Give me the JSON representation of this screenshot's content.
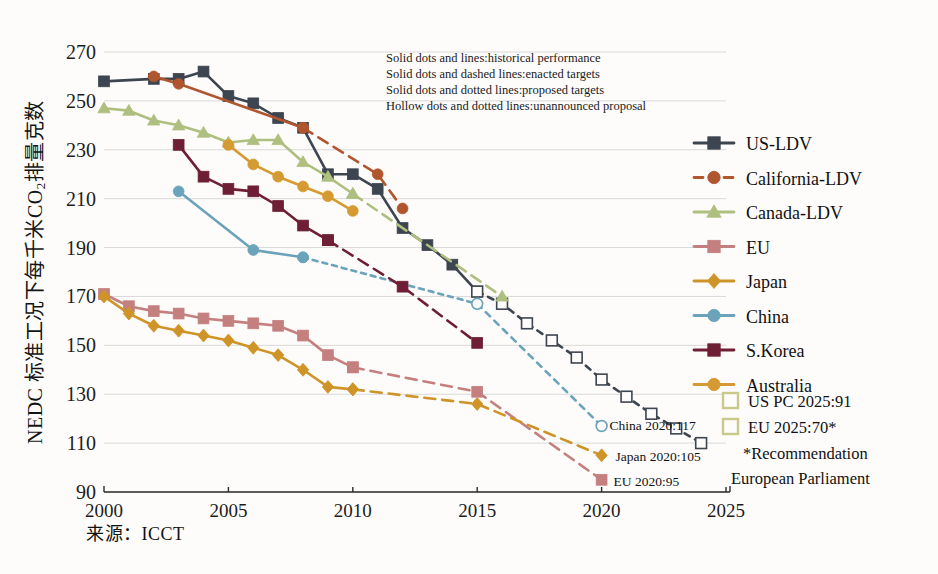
{
  "chart_data": {
    "type": "line",
    "title": "",
    "xlabel": "",
    "ylabel": "NEDC 标准工况下每千米CO2排量克数",
    "ylabel_prefix": "NEDC 标准工况下每千米CO",
    "ylabel_sub": "2",
    "ylabel_suffix": "排量克数",
    "source": "来源：ICCT",
    "xlim": [
      2000,
      2025.6
    ],
    "ylim": [
      90,
      270
    ],
    "yticks": [
      90,
      110,
      130,
      150,
      170,
      190,
      210,
      230,
      250,
      270
    ],
    "xticks": [
      2000,
      2005,
      2010,
      2015,
      2020,
      2025
    ],
    "grid": "horizontal",
    "legend_position": "right",
    "series": [
      {
        "name": "US-LDV",
        "color": "#3d4550",
        "marker": "square",
        "historical": [
          {
            "x": 2000,
            "y": 258
          },
          {
            "x": 2002,
            "y": 259
          },
          {
            "x": 2003,
            "y": 259
          },
          {
            "x": 2004,
            "y": 262
          },
          {
            "x": 2005,
            "y": 252
          },
          {
            "x": 2006,
            "y": 249
          },
          {
            "x": 2007,
            "y": 243
          },
          {
            "x": 2008,
            "y": 239
          },
          {
            "x": 2009,
            "y": 220
          },
          {
            "x": 2010,
            "y": 220
          },
          {
            "x": 2011,
            "y": 214
          },
          {
            "x": 2012,
            "y": 198
          },
          {
            "x": 2013,
            "y": 191
          },
          {
            "x": 2014,
            "y": 183
          },
          {
            "x": 2015,
            "y": 172
          }
        ],
        "unannounced": [
          {
            "x": 2015,
            "y": 172
          },
          {
            "x": 2016,
            "y": 167
          },
          {
            "x": 2017,
            "y": 159
          },
          {
            "x": 2018,
            "y": 152
          },
          {
            "x": 2019,
            "y": 145
          },
          {
            "x": 2020,
            "y": 136
          },
          {
            "x": 2021,
            "y": 129
          },
          {
            "x": 2022,
            "y": 122
          },
          {
            "x": 2023,
            "y": 116
          },
          {
            "x": 2024,
            "y": 110
          }
        ]
      },
      {
        "name": "California-LDV",
        "color": "#b0562f",
        "marker": "circle",
        "historical": [
          {
            "x": 2002,
            "y": 260
          },
          {
            "x": 2003,
            "y": 257
          },
          {
            "x": 2008,
            "y": 239
          }
        ],
        "enacted": [
          {
            "x": 2008,
            "y": 239
          },
          {
            "x": 2011,
            "y": 220
          },
          {
            "x": 2012,
            "y": 206
          }
        ]
      },
      {
        "name": "Canada-LDV",
        "color": "#aebf7f",
        "marker": "triangle",
        "historical": [
          {
            "x": 2000,
            "y": 247
          },
          {
            "x": 2001,
            "y": 246
          },
          {
            "x": 2002,
            "y": 242
          },
          {
            "x": 2003,
            "y": 240
          },
          {
            "x": 2004,
            "y": 237
          },
          {
            "x": 2005,
            "y": 233
          },
          {
            "x": 2006,
            "y": 234
          },
          {
            "x": 2007,
            "y": 234
          },
          {
            "x": 2008,
            "y": 225
          },
          {
            "x": 2009,
            "y": 219
          },
          {
            "x": 2010,
            "y": 212
          }
        ],
        "enacted": [
          {
            "x": 2010,
            "y": 212
          },
          {
            "x": 2016,
            "y": 170
          }
        ]
      },
      {
        "name": "EU",
        "color": "#c4807f",
        "marker": "square",
        "historical": [
          {
            "x": 2000,
            "y": 171
          },
          {
            "x": 2001,
            "y": 166
          },
          {
            "x": 2002,
            "y": 164
          },
          {
            "x": 2003,
            "y": 163
          },
          {
            "x": 2004,
            "y": 161
          },
          {
            "x": 2005,
            "y": 160
          },
          {
            "x": 2006,
            "y": 159
          },
          {
            "x": 2007,
            "y": 158
          },
          {
            "x": 2008,
            "y": 154
          },
          {
            "x": 2009,
            "y": 146
          },
          {
            "x": 2010,
            "y": 141
          }
        ],
        "enacted": [
          {
            "x": 2010,
            "y": 141
          },
          {
            "x": 2015,
            "y": 131
          },
          {
            "x": 2020,
            "y": 95
          }
        ]
      },
      {
        "name": "Japan",
        "color": "#cf9428",
        "marker": "diamond",
        "historical": [
          {
            "x": 2000,
            "y": 170
          },
          {
            "x": 2001,
            "y": 163
          },
          {
            "x": 2002,
            "y": 158
          },
          {
            "x": 2003,
            "y": 156
          },
          {
            "x": 2004,
            "y": 154
          },
          {
            "x": 2005,
            "y": 152
          },
          {
            "x": 2006,
            "y": 149
          },
          {
            "x": 2007,
            "y": 146
          },
          {
            "x": 2008,
            "y": 140
          },
          {
            "x": 2009,
            "y": 133
          },
          {
            "x": 2010,
            "y": 132
          }
        ],
        "enacted": [
          {
            "x": 2010,
            "y": 132
          },
          {
            "x": 2015,
            "y": 126
          },
          {
            "x": 2020,
            "y": 105
          }
        ]
      },
      {
        "name": "China",
        "color": "#6ba3bb",
        "marker": "circle",
        "historical": [
          {
            "x": 2003,
            "y": 213
          },
          {
            "x": 2006,
            "y": 189
          },
          {
            "x": 2008,
            "y": 186
          }
        ],
        "proposed": [
          {
            "x": 2008,
            "y": 186
          },
          {
            "x": 2015,
            "y": 167
          }
        ],
        "unannounced": [
          {
            "x": 2015,
            "y": 167
          },
          {
            "x": 2020,
            "y": 117
          }
        ]
      },
      {
        "name": "S.Korea",
        "color": "#6e1f36",
        "marker": "square",
        "historical": [
          {
            "x": 2003,
            "y": 232
          },
          {
            "x": 2004,
            "y": 219
          },
          {
            "x": 2005,
            "y": 214
          },
          {
            "x": 2006,
            "y": 213
          },
          {
            "x": 2007,
            "y": 207
          },
          {
            "x": 2008,
            "y": 199
          },
          {
            "x": 2009,
            "y": 193
          }
        ],
        "enacted": [
          {
            "x": 2009,
            "y": 193
          },
          {
            "x": 2012,
            "y": 174
          },
          {
            "x": 2015,
            "y": 151
          }
        ]
      },
      {
        "name": "Australia",
        "color": "#d69a32",
        "marker": "circle",
        "historical": [
          {
            "x": 2005,
            "y": 232
          },
          {
            "x": 2006,
            "y": 224
          },
          {
            "x": 2007,
            "y": 219
          },
          {
            "x": 2008,
            "y": 215
          },
          {
            "x": 2009,
            "y": 211
          },
          {
            "x": 2010,
            "y": 205
          }
        ]
      }
    ],
    "annotations": [
      {
        "label": "China 2020:117",
        "x": 2020,
        "y": 117
      },
      {
        "label": "Japan 2020:105",
        "x": 2020,
        "y": 105
      },
      {
        "label": "EU 2020:95",
        "x": 2020,
        "y": 95
      }
    ]
  },
  "notes": {
    "lines": [
      "Solid dots and lines:historical performance",
      "Solid dots and dashed lines:enacted targets",
      "Solid dots and dotted lines:proposed targets",
      "Hollow dots and dotted lines:unannounced proposal"
    ]
  },
  "legend": {
    "items": [
      {
        "label": "US-LDV",
        "color": "#3d4550",
        "marker": "square",
        "dash": "solid"
      },
      {
        "label": "California-LDV",
        "color": "#b0562f",
        "marker": "circle",
        "dash": "dashed"
      },
      {
        "label": "Canada-LDV",
        "color": "#aebf7f",
        "marker": "triangle",
        "dash": "solid"
      },
      {
        "label": "EU",
        "color": "#c4807f",
        "marker": "square",
        "dash": "solid"
      },
      {
        "label": "Japan",
        "color": "#cf9428",
        "marker": "diamond",
        "dash": "solid"
      },
      {
        "label": "China",
        "color": "#6ba3bb",
        "marker": "circle",
        "dash": "solid"
      },
      {
        "label": "S.Korea",
        "color": "#6e1f36",
        "marker": "square",
        "dash": "solid"
      },
      {
        "label": "Australia",
        "color": "#d69a32",
        "marker": "circle",
        "dash": "solid"
      }
    ]
  },
  "target_box": {
    "swatch_color": "#c9c98a",
    "rows": [
      "US PC 2025:91",
      "EU 2025:70*"
    ],
    "footnote_line1": "*Recommendation",
    "footnote_line2": "European Parliament"
  }
}
